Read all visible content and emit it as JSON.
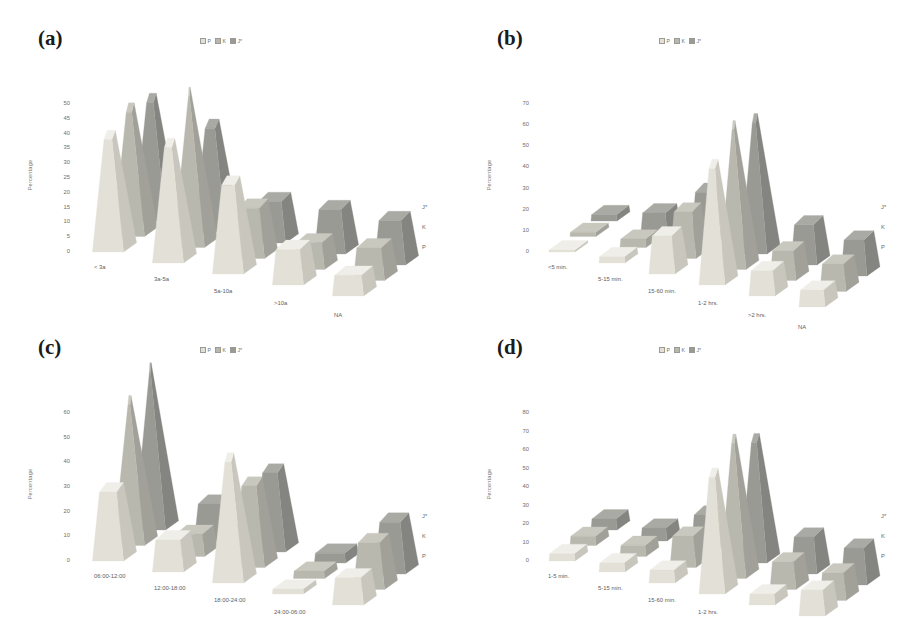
{
  "figure": {
    "background": "#ffffff",
    "series_colors": {
      "P": "#e3e1d7",
      "K": "#b9b8ae",
      "J*": "#9a9a95"
    },
    "series_colors_side": {
      "P": "#c9c7bd",
      "K": "#a2a199",
      "J*": "#848480"
    },
    "series_colors_top": {
      "P": "#efeee8",
      "K": "#c9c8bf",
      "J*": "#aaaaa5"
    },
    "legend_items": [
      "P",
      "K",
      "J*"
    ],
    "y_axis_title": "Percentage",
    "depth_labels": [
      "J*",
      "K",
      "P"
    ]
  },
  "panels": [
    {
      "tag": "(a)",
      "chart_data": {
        "type": "bar",
        "title": "",
        "xlabel": "",
        "ylabel": "Percentage",
        "ylim": [
          0,
          50
        ],
        "yticks": [
          0,
          5,
          10,
          15,
          20,
          25,
          30,
          35,
          40,
          45,
          50
        ],
        "grid": false,
        "legend_position": "top-center",
        "categories": [
          "< 3a",
          "3a-5a",
          "5a-10a",
          ">10a",
          "NA"
        ],
        "depth_categories": [
          "P",
          "K",
          "J*"
        ],
        "series": [
          {
            "name": "P",
            "values": [
              38,
              39,
              30,
              12,
              7
            ]
          },
          {
            "name": "K",
            "values": [
              42,
              51,
              17,
              9,
              11
            ]
          },
          {
            "name": "J*",
            "values": [
              40,
              35,
              14,
              15,
              15
            ]
          }
        ]
      }
    },
    {
      "tag": "(b)",
      "chart_data": {
        "type": "bar",
        "title": "",
        "xlabel": "",
        "ylabel": "Percentage",
        "ylim": [
          0,
          70
        ],
        "yticks": [
          0,
          10,
          20,
          30,
          40,
          50,
          60,
          70
        ],
        "grid": false,
        "legend_position": "top-center",
        "categories": [
          "<5 min.",
          "5-15 min.",
          "15-60 min.",
          "1-2 hrs.",
          ">2 hrs.",
          "NA"
        ],
        "depth_categories": [
          "P",
          "K",
          "J*"
        ],
        "series": [
          {
            "name": "P",
            "values": [
              1,
              3,
              18,
              55,
              12,
              8
            ]
          },
          {
            "name": "K",
            "values": [
              2,
              4,
              22,
              66,
              14,
              13
            ]
          },
          {
            "name": "J*",
            "values": [
              3,
              9,
              24,
              62,
              19,
              17
            ]
          }
        ]
      }
    },
    {
      "tag": "(c)",
      "chart_data": {
        "type": "bar",
        "title": "",
        "xlabel": "",
        "ylabel": "Percentage",
        "ylim": [
          0,
          60
        ],
        "yticks": [
          0,
          10,
          20,
          30,
          40,
          50,
          60
        ],
        "grid": false,
        "legend_position": "top-center",
        "categories": [
          "06:00-12:00",
          "12:00-18:00",
          "18:00-24:00",
          "24:00-06:00",
          "NA"
        ],
        "depth_categories": [
          "P",
          "K",
          "J*"
        ],
        "series": [
          {
            "name": "P",
            "values": [
              28,
              13,
              49,
              2,
              11
            ]
          },
          {
            "name": "K",
            "values": [
              57,
              9,
              33,
              3,
              19
            ]
          },
          {
            "name": "J*",
            "values": [
              64,
              15,
              32,
              4,
              21
            ]
          }
        ]
      }
    },
    {
      "tag": "(d)",
      "chart_data": {
        "type": "bar",
        "title": "",
        "xlabel": "",
        "ylabel": "Percentage",
        "ylim": [
          0,
          80
        ],
        "yticks": [
          0,
          10,
          20,
          30,
          40,
          50,
          60,
          70,
          80
        ],
        "grid": false,
        "legend_position": "top-center",
        "categories": [
          "1-5 min.",
          "5-15 min.",
          "15-60 min.",
          "1-2 hrs.",
          ">2 hrs.",
          "NA"
        ],
        "depth_categories": [
          "P",
          "K",
          "J*"
        ],
        "series": [
          {
            "name": "P",
            "values": [
              4,
              5,
              7,
              63,
              6,
              14
            ]
          },
          {
            "name": "K",
            "values": [
              5,
              6,
              17,
              73,
              15,
              15
            ]
          },
          {
            "name": "J*",
            "values": [
              6,
              7,
              20,
              65,
              20,
              20
            ]
          }
        ]
      }
    }
  ]
}
